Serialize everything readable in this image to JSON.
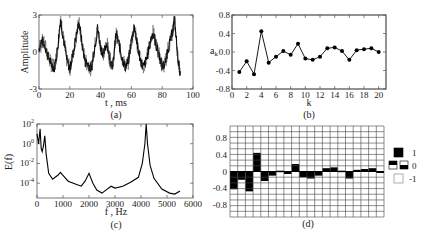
{
  "chart_data": [
    {
      "id": "a",
      "type": "line",
      "caption": "(a)",
      "xlabel": "t , ms",
      "ylabel": "Amplitude",
      "xlim": [
        0,
        100
      ],
      "ylim": [
        -3,
        3
      ],
      "xticks": [
        "0",
        "20",
        "40",
        "60",
        "80",
        "100"
      ],
      "yticks": [
        "-3",
        "0",
        "3"
      ],
      "description": "Noisy quasi-periodic signal, period ~12 ms, peaks near t=14, 25, 38, 51, 62, 75, 87 ms, data ends ~92 ms",
      "x": [
        0,
        2,
        4,
        6,
        8,
        10,
        12,
        14,
        16,
        18,
        20,
        22,
        24,
        26,
        28,
        30,
        32,
        34,
        36,
        38,
        40,
        42,
        44,
        46,
        48,
        50,
        52,
        54,
        56,
        58,
        60,
        62,
        64,
        66,
        68,
        70,
        72,
        74,
        76,
        78,
        80,
        82,
        84,
        86,
        88,
        90,
        92
      ],
      "y": [
        0.3,
        0.9,
        0.5,
        -0.4,
        -1.0,
        -1.3,
        0.2,
        2.7,
        1.0,
        -0.6,
        -1.4,
        -0.2,
        1.2,
        2.4,
        0.6,
        -0.8,
        -1.0,
        -1.4,
        0.3,
        1.9,
        0.4,
        -0.2,
        0.8,
        -0.6,
        -1.1,
        1.5,
        0.6,
        -0.5,
        -1.2,
        -0.8,
        0.9,
        2.1,
        0.4,
        -0.7,
        -1.3,
        -0.5,
        0.7,
        1.6,
        0.6,
        -0.2,
        -1.2,
        -0.9,
        0.4,
        1.2,
        2.7,
        -0.3,
        -2.0
      ]
    },
    {
      "id": "b",
      "type": "line",
      "caption": "(b)",
      "xlabel": "k",
      "ylabel": "a_k",
      "xlim": [
        0,
        21
      ],
      "ylim": [
        -0.8,
        0.8
      ],
      "xticks": [
        "0",
        "2",
        "4",
        "6",
        "8",
        "10",
        "12",
        "14",
        "16",
        "18",
        "20"
      ],
      "yticks": [
        "-0.8",
        "-0.4",
        "0.0",
        "0.4",
        "0.8"
      ],
      "markers": "filled-circle",
      "x": [
        1,
        2,
        3,
        4,
        5,
        6,
        7,
        8,
        9,
        10,
        11,
        12,
        13,
        14,
        15,
        16,
        17,
        18,
        19,
        20
      ],
      "y": [
        -0.43,
        -0.2,
        -0.48,
        0.45,
        -0.23,
        -0.1,
        0.02,
        -0.06,
        0.18,
        -0.14,
        -0.17,
        -0.1,
        0.08,
        0.1,
        0.02,
        -0.17,
        0.04,
        0.06,
        0.08,
        0.0
      ]
    },
    {
      "id": "c",
      "type": "line",
      "caption": "(c)",
      "xlabel": "f , Hz",
      "ylabel": "E(f)",
      "yscale": "log",
      "xlim": [
        0,
        6000
      ],
      "ylim_log10": [
        -5.5,
        2
      ],
      "xticks": [
        "0",
        "1000",
        "2000",
        "3000",
        "4000",
        "5000",
        "6000"
      ],
      "yticks": [
        "10^-4",
        "10^-2",
        "10^0",
        "10^2"
      ],
      "x": [
        0,
        60,
        120,
        160,
        200,
        250,
        300,
        350,
        450,
        600,
        800,
        900,
        1000,
        1200,
        1500,
        1700,
        1850,
        2000,
        2150,
        2300,
        2500,
        2700,
        2850,
        3000,
        3300,
        3600,
        3900,
        4050,
        4150,
        4200,
        4250,
        4350,
        4500,
        4800,
        5100,
        5300,
        5500
      ],
      "log10_y": [
        1.0,
        0.0,
        1.5,
        -0.5,
        -0.8,
        -0.2,
        0.8,
        -1.0,
        -3.0,
        -3.6,
        -3.2,
        -2.9,
        -3.2,
        -3.8,
        -4.1,
        -4.3,
        -3.8,
        -3.0,
        -4.0,
        -4.7,
        -5.0,
        -4.6,
        -4.3,
        -4.5,
        -4.3,
        -3.9,
        -3.4,
        -2.0,
        0.0,
        2.0,
        0.0,
        -2.2,
        -3.5,
        -4.6,
        -5.0,
        -5.1,
        -4.8
      ]
    },
    {
      "id": "d",
      "type": "heatmap",
      "caption": "(d)",
      "grid_columns": 20,
      "grid_rows": 16,
      "yticks": [
        "0.8",
        "0.4",
        "0",
        "-0.4",
        "-0.8"
      ],
      "description": "Binary-grid rendering of the coefficients in (b): black cells fill from 0 toward each a_k value",
      "values": [
        -0.43,
        -0.2,
        -0.48,
        0.45,
        -0.23,
        -0.1,
        0.02,
        -0.06,
        0.18,
        -0.14,
        -0.17,
        -0.1,
        0.08,
        0.1,
        0.02,
        -0.17,
        0.04,
        0.06,
        0.08,
        0.0
      ],
      "legend": [
        {
          "label": "1",
          "swatch": "full-black"
        },
        {
          "label": "0",
          "swatch": "half-black"
        },
        {
          "label": "-1",
          "swatch": "white"
        }
      ]
    }
  ]
}
